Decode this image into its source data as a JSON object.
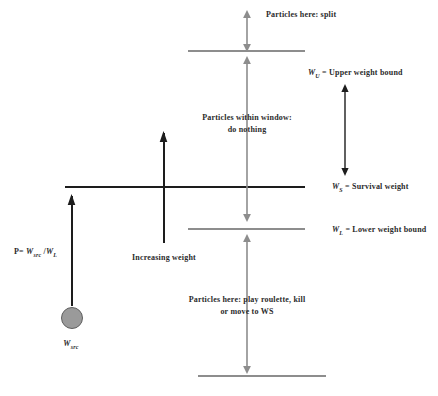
{
  "diagram": {
    "colors": {
      "gray_line": "#8d8d8d",
      "black_line": "#1d1d1d",
      "gray_arrow": "#8d8d8d",
      "black_arrow": "#1d1d1d",
      "circle_fill": "#9a9a9a",
      "circle_stroke": "#5f5f5f",
      "text": "#2b2b2b",
      "background": "#ffffff"
    },
    "annotations": {
      "split": "Particles here: split",
      "within_window_line1": "Particles within window:",
      "within_window_line2": "do nothing",
      "roulette_line1": "Particles here: play roulette, kill",
      "roulette_line2": "or move to WS",
      "increasing_weight": "Increasing weight"
    },
    "bounds": {
      "upper_symbol": "W",
      "upper_subscript": "U",
      "upper_text": " = Upper weight bound",
      "survival_symbol": "W",
      "survival_subscript": "S",
      "survival_text": " = Survival weight",
      "lower_symbol": "W",
      "lower_subscript": "L",
      "lower_text": " = Lower weight bound"
    },
    "formula": {
      "prefix": "P= ",
      "numerator_symbol": "W",
      "numerator_subscript": "src",
      "divider": " /",
      "denominator_symbol": "W",
      "denominator_subscript": "L"
    },
    "source_particle": {
      "symbol": "W",
      "subscript": "src"
    }
  }
}
